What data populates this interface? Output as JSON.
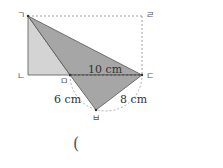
{
  "figure": {
    "vertices": {
      "g": {
        "label": "ㄱ",
        "x": 28,
        "y": 16
      },
      "n": {
        "label": "ㄴ",
        "x": 28,
        "y": 75
      },
      "d": {
        "label": "ㄷ",
        "x": 142,
        "y": 75
      },
      "r": {
        "label": "ㄹ",
        "x": 142,
        "y": 16
      },
      "m": {
        "label": "ㅁ",
        "x": 70,
        "y": 75
      },
      "b": {
        "label": "ㅂ",
        "x": 96,
        "y": 110
      }
    },
    "measurements": {
      "md": "10 cm",
      "mb": "6 cm",
      "bd": "8 cm"
    },
    "colors": {
      "light_fill": "#d4d4d4",
      "dark_fill": "#a6a6a6",
      "stroke": "#555555",
      "dashed": "#888888"
    }
  },
  "answer": {
    "open_paren": "("
  }
}
